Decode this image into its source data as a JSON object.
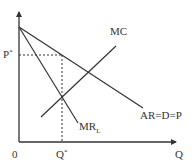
{
  "diagram": {
    "type": "economics-monopoly-equilibrium",
    "line_color": "#333333",
    "axes": {
      "y_label": "",
      "x_label": "Q",
      "origin_label": "0"
    },
    "curves": {
      "mc": {
        "label": "MC"
      },
      "mr": {
        "label": "MR",
        "subscript": "L"
      },
      "ar": {
        "label": "AR=D=P"
      }
    },
    "equilibrium": {
      "price_label": "P",
      "price_superscript": "*",
      "quantity_label": "Q",
      "quantity_superscript": "*"
    }
  }
}
